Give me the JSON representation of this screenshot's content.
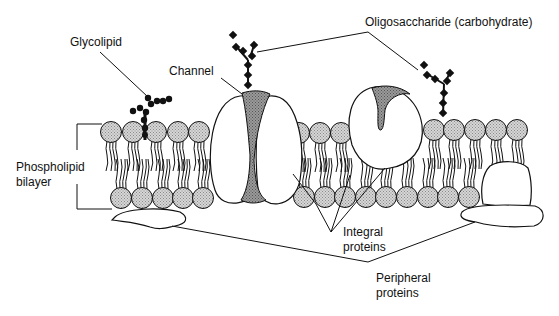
{
  "diagram": {
    "labels": {
      "glycolipid": "Glycolipid",
      "channel": "Channel",
      "oligosaccharide": "Oligosaccharide (carbohydrate)",
      "phospholipid_line1": "Phospholipid",
      "phospholipid_line2": "bilayer",
      "integral_line1": "Integral",
      "integral_line2": "proteins",
      "peripheral_line1": "Peripheral",
      "peripheral_line2": "proteins"
    },
    "colors": {
      "line": "#111111",
      "head_fill": "#c8c8c8",
      "shaded_fill": "#8c8c8c",
      "carbohydrate": "#111111",
      "background": "#ffffff"
    }
  }
}
